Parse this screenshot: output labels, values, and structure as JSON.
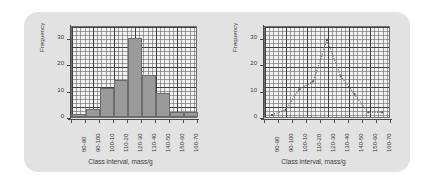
{
  "panel": {
    "background": "#e2e2e2"
  },
  "figures": [
    {
      "id": "histogram",
      "axis_y_title": "Frequency",
      "axis_x_title": "Class interval, mass/g",
      "y_ticks": [
        "0",
        "10",
        "20",
        "30"
      ]
    },
    {
      "id": "frequency-polygon",
      "axis_y_title": "Frequency",
      "axis_x_title": "Class interval, mass/g",
      "y_ticks": [
        "0",
        "10",
        "20",
        "30"
      ]
    }
  ],
  "chart_data": [
    {
      "type": "bar",
      "title": "",
      "xlabel": "Class interval, mass/g",
      "ylabel": "Frequency",
      "categories": [
        "80-90",
        "90-100",
        "100-10",
        "110-20",
        "120-30",
        "130-40",
        "140-50",
        "150-60",
        "160-70"
      ],
      "values": [
        1,
        3,
        11,
        14,
        30,
        16,
        9,
        2,
        2
      ],
      "ylim": [
        0,
        35
      ],
      "yticks": [
        0,
        10,
        20,
        30
      ],
      "grid": true,
      "legend": "none",
      "bar_color": "#9a9a9a",
      "bar_edge_color": "#6b6b6b"
    },
    {
      "type": "line",
      "title": "",
      "xlabel": "Class interval, mass/g",
      "ylabel": "Frequency",
      "categories": [
        "80-90",
        "90-100",
        "100-10",
        "110-20",
        "120-30",
        "130-40",
        "140-50",
        "150-60",
        "160-70"
      ],
      "values": [
        1,
        3,
        11,
        14,
        30,
        16,
        9,
        2,
        2
      ],
      "ylim": [
        0,
        35
      ],
      "yticks": [
        0,
        10,
        20,
        30
      ],
      "grid": true,
      "legend": "none",
      "line_style": "dotted",
      "line_color": "#6b6b6b"
    }
  ]
}
